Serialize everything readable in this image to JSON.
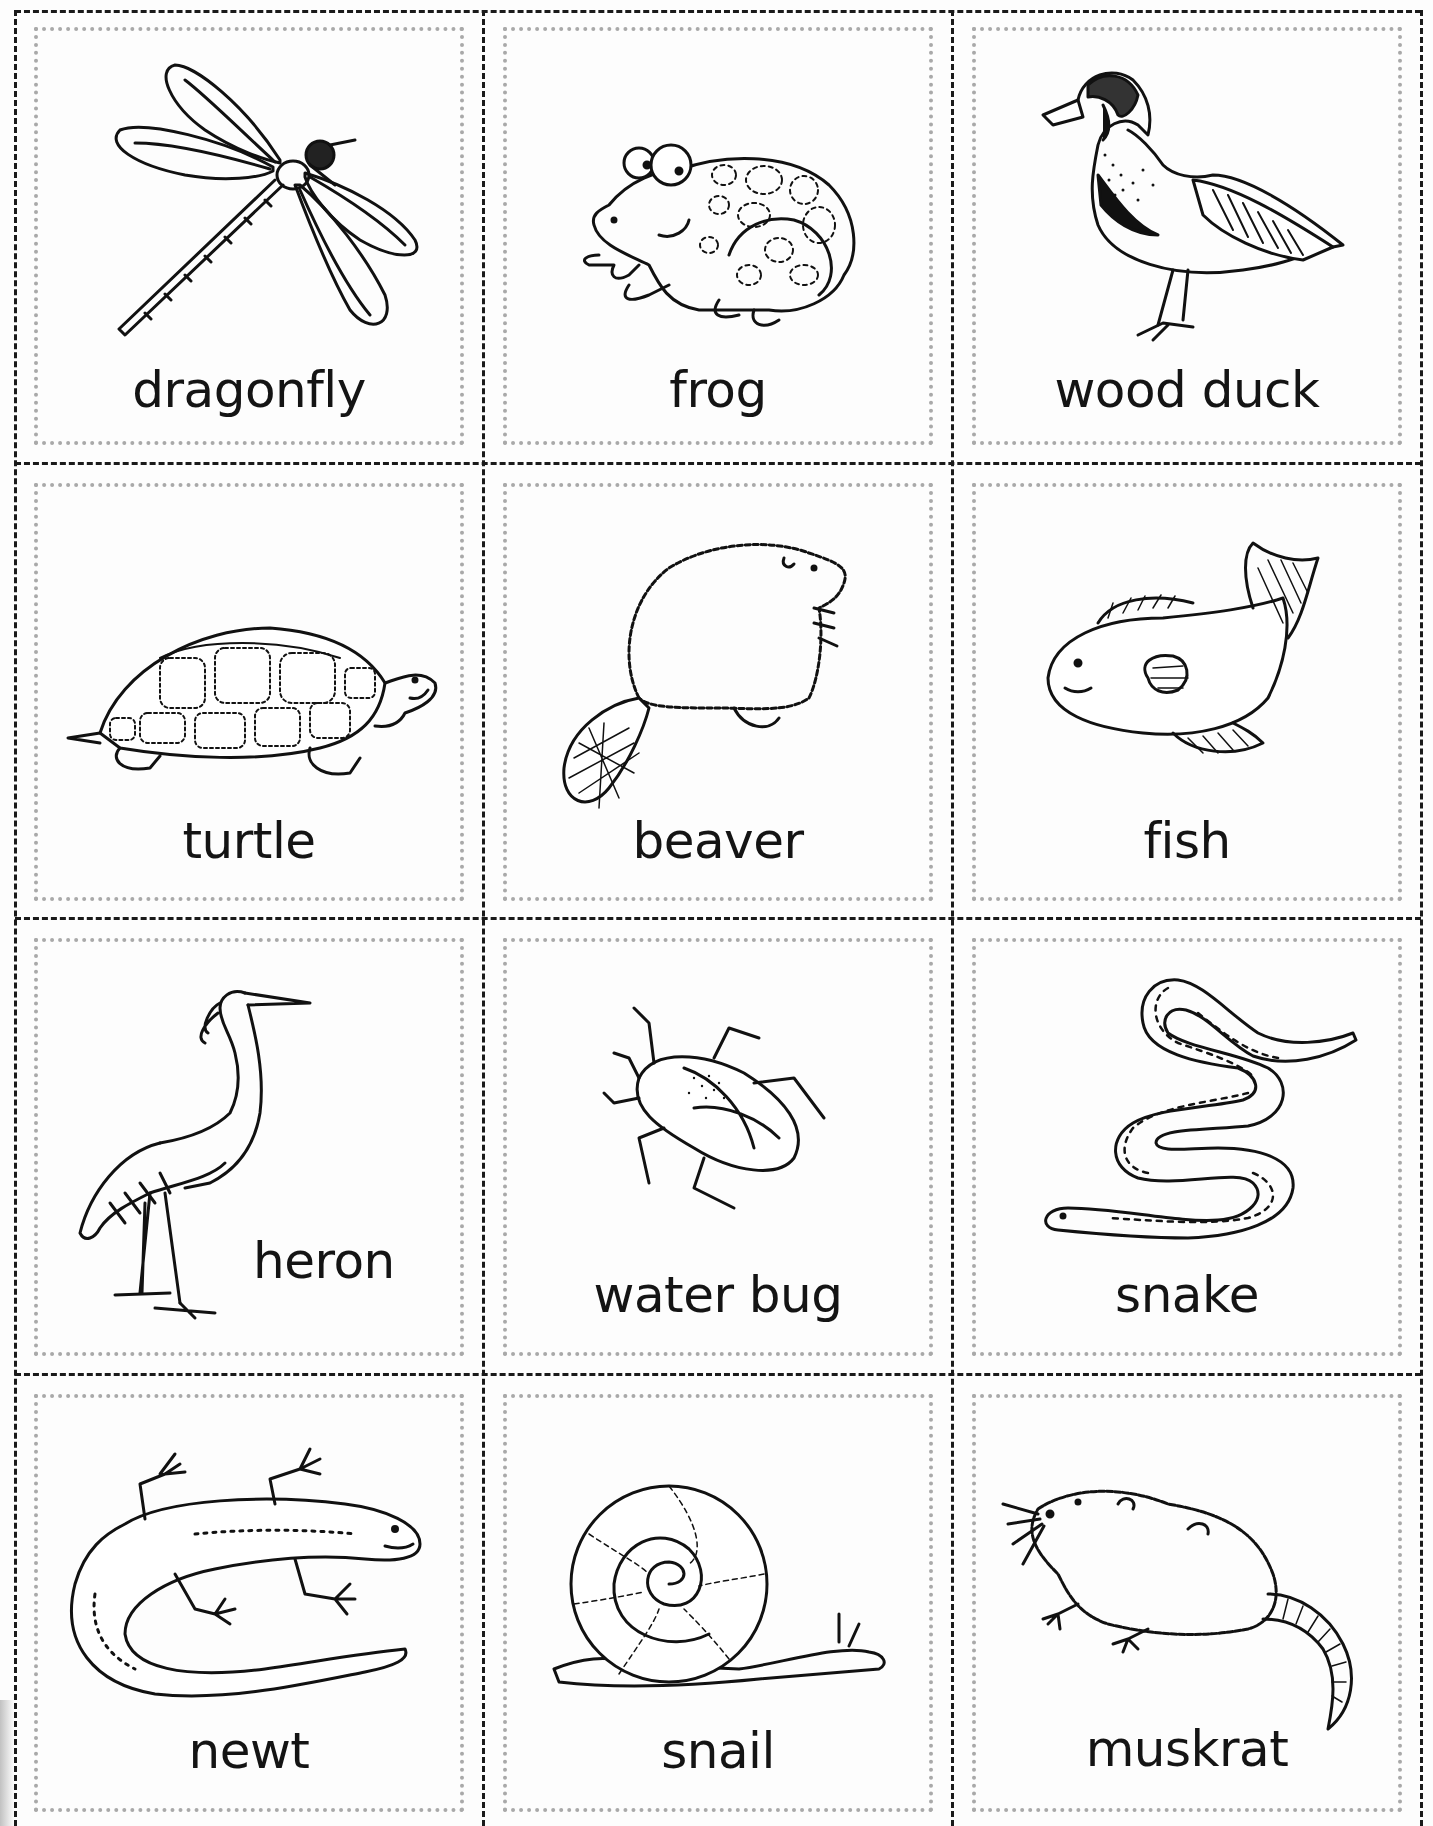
{
  "sheet": {
    "title": "Pond animal picture cards",
    "columns": 3,
    "rows": 4,
    "line_color": "#1a1a1a",
    "dotted_color": "#a9a9a9"
  },
  "cards": [
    {
      "id": "dragonfly",
      "label": "dragonfly"
    },
    {
      "id": "frog",
      "label": "frog"
    },
    {
      "id": "wood-duck",
      "label": "wood duck"
    },
    {
      "id": "turtle",
      "label": "turtle"
    },
    {
      "id": "beaver",
      "label": "beaver"
    },
    {
      "id": "fish",
      "label": "fish"
    },
    {
      "id": "heron",
      "label": "heron"
    },
    {
      "id": "water-bug",
      "label": "water bug"
    },
    {
      "id": "snake",
      "label": "snake"
    },
    {
      "id": "newt",
      "label": "newt"
    },
    {
      "id": "snail",
      "label": "snail"
    },
    {
      "id": "muskrat",
      "label": "muskrat"
    }
  ]
}
